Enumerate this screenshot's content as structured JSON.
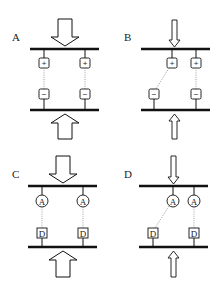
{
  "panels": [
    {
      "label": "A",
      "arrow": "wide",
      "top_sym": "+",
      "bottom_sym": "−",
      "top_shape": "square",
      "bottom_shape": "square",
      "left_link": "straight",
      "right_link": "straight"
    },
    {
      "label": "B",
      "arrow": "narrow",
      "top_sym": "+",
      "bottom_sym": "−",
      "top_shape": "square",
      "bottom_shape": "square",
      "left_link": "diagonal",
      "right_link": "straight"
    },
    {
      "label": "C",
      "arrow": "wide",
      "top_sym": "A",
      "bottom_sym": "D",
      "top_shape": "circle",
      "bottom_shape": "square",
      "left_link": "straight",
      "right_link": "straight"
    },
    {
      "label": "D",
      "arrow": "narrow",
      "top_sym": "A",
      "bottom_sym": "D",
      "top_shape": "circle",
      "bottom_shape": "square",
      "left_link": "diagonal",
      "right_link": "straight"
    }
  ],
  "colors": {
    "stroke": "#111111",
    "background": "#ffffff",
    "dotted": "#888888"
  }
}
